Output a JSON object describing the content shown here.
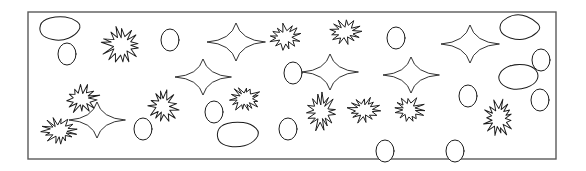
{
  "canvas": {
    "width": 586,
    "height": 171,
    "background": "#ffffff"
  },
  "frame": {
    "x": 28,
    "y": 12,
    "width": 528,
    "height": 147,
    "stroke": "#5a5a5a",
    "fill": "#ffffff",
    "stroke_width": 1.4
  },
  "style": {
    "shape_stroke": "#1b1b1b",
    "shape_fill": "#ffffff"
  },
  "legend": {
    "shape_kinds": [
      "blob",
      "ellipse",
      "burst",
      "star"
    ],
    "counts": {
      "blob": 5,
      "ellipse": 16,
      "burst": 13,
      "star": 7
    },
    "total": 41
  },
  "shapes": [
    {
      "kind": "blob",
      "name": "blob-1",
      "cx": 59,
      "cy": 28,
      "rx": 22,
      "ry": 13,
      "rot": -6
    },
    {
      "kind": "ellipse",
      "name": "ellipse-1",
      "cx": 67,
      "cy": 54,
      "rx": 9,
      "ry": 11,
      "rot": 0
    },
    {
      "kind": "burst",
      "name": "burst-1",
      "cx": 121,
      "cy": 45,
      "rx": 18,
      "ry": 17,
      "rot": 8
    },
    {
      "kind": "ellipse",
      "name": "ellipse-2",
      "cx": 170,
      "cy": 40,
      "rx": 9,
      "ry": 11,
      "rot": 0
    },
    {
      "kind": "star",
      "name": "star-1",
      "cx": 236,
      "cy": 42,
      "rx": 29,
      "ry": 19,
      "rot": 0
    },
    {
      "kind": "burst",
      "name": "burst-2",
      "cx": 285,
      "cy": 37,
      "rx": 15,
      "ry": 12,
      "rot": -4
    },
    {
      "kind": "burst",
      "name": "burst-3",
      "cx": 345,
      "cy": 32,
      "rx": 15,
      "ry": 12,
      "rot": 6
    },
    {
      "kind": "ellipse",
      "name": "ellipse-3",
      "cx": 396,
      "cy": 38,
      "rx": 9,
      "ry": 11,
      "rot": 0
    },
    {
      "kind": "star",
      "name": "star-2",
      "cx": 470,
      "cy": 44,
      "rx": 29,
      "ry": 19,
      "rot": 0
    },
    {
      "kind": "blob",
      "name": "blob-2",
      "cx": 519,
      "cy": 27,
      "rx": 22,
      "ry": 14,
      "rot": 4
    },
    {
      "kind": "star",
      "name": "star-3",
      "cx": 203,
      "cy": 77,
      "rx": 28,
      "ry": 18,
      "rot": 0
    },
    {
      "kind": "star",
      "name": "star-4",
      "cx": 330,
      "cy": 72,
      "rx": 28,
      "ry": 18,
      "rot": 0
    },
    {
      "kind": "star",
      "name": "star-5",
      "cx": 411,
      "cy": 75,
      "rx": 28,
      "ry": 18,
      "rot": 0
    },
    {
      "kind": "ellipse",
      "name": "ellipse-4",
      "cx": 293,
      "cy": 73,
      "rx": 9,
      "ry": 11,
      "rot": 0
    },
    {
      "kind": "ellipse",
      "name": "ellipse-5",
      "cx": 541,
      "cy": 60,
      "rx": 9,
      "ry": 11,
      "rot": 0
    },
    {
      "kind": "blob",
      "name": "blob-3",
      "cx": 518,
      "cy": 77,
      "rx": 21,
      "ry": 13,
      "rot": -5
    },
    {
      "kind": "burst",
      "name": "burst-4",
      "cx": 82,
      "cy": 99,
      "rx": 16,
      "ry": 13,
      "rot": -10
    },
    {
      "kind": "star",
      "name": "star-6",
      "cx": 97,
      "cy": 120,
      "rx": 28,
      "ry": 18,
      "rot": 0
    },
    {
      "kind": "burst",
      "name": "burst-5",
      "cx": 59,
      "cy": 131,
      "rx": 16,
      "ry": 12,
      "rot": 5
    },
    {
      "kind": "burst",
      "name": "burst-6",
      "cx": 163,
      "cy": 106,
      "rx": 14,
      "ry": 16,
      "rot": -8
    },
    {
      "kind": "ellipse",
      "name": "ellipse-6",
      "cx": 143,
      "cy": 129,
      "rx": 9,
      "ry": 11,
      "rot": 0
    },
    {
      "kind": "ellipse",
      "name": "ellipse-7",
      "cx": 214,
      "cy": 112,
      "rx": 9,
      "ry": 11,
      "rot": 0
    },
    {
      "kind": "burst",
      "name": "burst-7",
      "cx": 245,
      "cy": 99,
      "rx": 15,
      "ry": 12,
      "rot": 4
    },
    {
      "kind": "blob",
      "name": "blob-4",
      "cx": 237,
      "cy": 135,
      "rx": 22,
      "ry": 14,
      "rot": -3
    },
    {
      "kind": "ellipse",
      "name": "ellipse-8",
      "cx": 288,
      "cy": 129,
      "rx": 9,
      "ry": 11,
      "rot": 0
    },
    {
      "kind": "burst",
      "name": "burst-8",
      "cx": 321,
      "cy": 112,
      "rx": 14,
      "ry": 17,
      "rot": 6
    },
    {
      "kind": "burst",
      "name": "burst-9",
      "cx": 364,
      "cy": 110,
      "rx": 15,
      "ry": 12,
      "rot": -5
    },
    {
      "kind": "burst",
      "name": "burst-10",
      "cx": 409,
      "cy": 110,
      "rx": 15,
      "ry": 12,
      "rot": 3
    },
    {
      "kind": "ellipse",
      "name": "ellipse-9",
      "cx": 468,
      "cy": 96,
      "rx": 9,
      "ry": 11,
      "rot": 0
    },
    {
      "kind": "burst",
      "name": "burst-11",
      "cx": 499,
      "cy": 118,
      "rx": 14,
      "ry": 17,
      "rot": 7
    },
    {
      "kind": "ellipse",
      "name": "ellipse-10",
      "cx": 540,
      "cy": 100,
      "rx": 9,
      "ry": 11,
      "rot": 0
    },
    {
      "kind": "ellipse",
      "name": "ellipse-11",
      "cx": 385,
      "cy": 151,
      "rx": 9,
      "ry": 11,
      "rot": 0
    },
    {
      "kind": "ellipse",
      "name": "ellipse-12",
      "cx": 455,
      "cy": 151,
      "rx": 9,
      "ry": 11,
      "rot": 0
    },
    {
      "kind": "blob",
      "name": "blob-5",
      "cx": 512,
      "cy": 90,
      "rx": 0,
      "ry": 0,
      "rot": 0
    },
    {
      "kind": "ellipse",
      "name": "ellipse-13",
      "cx": 500,
      "cy": 57,
      "rx": 0,
      "ry": 0,
      "rot": 0
    },
    {
      "kind": "ellipse",
      "name": "ellipse-14",
      "cx": 64,
      "cy": 160,
      "rx": 0,
      "ry": 0,
      "rot": 0
    },
    {
      "kind": "ellipse",
      "name": "ellipse-15",
      "cx": 100,
      "cy": 160,
      "rx": 0,
      "ry": 0,
      "rot": 0
    },
    {
      "kind": "ellipse",
      "name": "ellipse-16",
      "cx": 140,
      "cy": 160,
      "rx": 0,
      "ry": 0,
      "rot": 0
    }
  ]
}
